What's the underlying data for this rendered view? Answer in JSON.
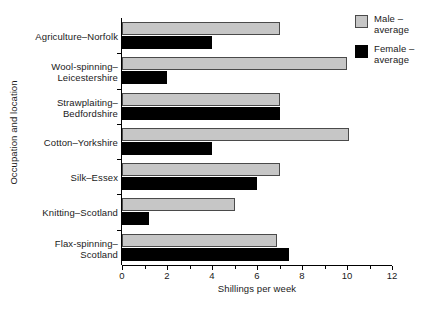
{
  "chart_data": {
    "type": "bar",
    "orientation": "horizontal",
    "title": "",
    "xlabel": "Shillings per week",
    "ylabel": "Occupation and location",
    "xlim": [
      0,
      13
    ],
    "xticks": [
      0,
      2,
      4,
      6,
      8,
      10,
      12
    ],
    "xtick_labels": [
      "0",
      "2",
      "4",
      "6",
      "8",
      "10",
      "12"
    ],
    "minor_ticks": [
      1,
      3,
      5,
      7,
      9,
      11
    ],
    "grid": false,
    "legend_position": "top-right",
    "categories": [
      "Agriculture–Norfolk",
      "Wool-spinning–Leicestershire",
      "Strawplaiting–Bedfordshire",
      "Cotton–Yorkshire",
      "Silk–Essex",
      "Knitting–Scotland",
      "Flax-spinning–Scotland"
    ],
    "category_lines": [
      [
        "Agriculture–Norfolk",
        ""
      ],
      [
        "Wool-spinning–",
        "Leicestershire"
      ],
      [
        "Strawplaiting–",
        "Bedfordshire"
      ],
      [
        "Cotton–Yorkshire",
        ""
      ],
      [
        "Silk–Essex",
        ""
      ],
      [
        "Knitting–Scotland",
        ""
      ],
      [
        "Flax-spinning–",
        "Scotland"
      ]
    ],
    "series": [
      {
        "name": "Male – average",
        "color": "#c6c6c6",
        "values": [
          7.0,
          10.0,
          7.0,
          10.1,
          7.0,
          5.0,
          6.9
        ]
      },
      {
        "name": "Female – average",
        "color": "#000000",
        "values": [
          4.0,
          2.0,
          7.0,
          4.0,
          6.0,
          1.2,
          7.4
        ]
      }
    ]
  },
  "legend": {
    "entries": [
      {
        "line1": "Male –",
        "line2": "average",
        "swatch": "male"
      },
      {
        "line1": "Female –",
        "line2": "average",
        "swatch": "female"
      }
    ]
  }
}
